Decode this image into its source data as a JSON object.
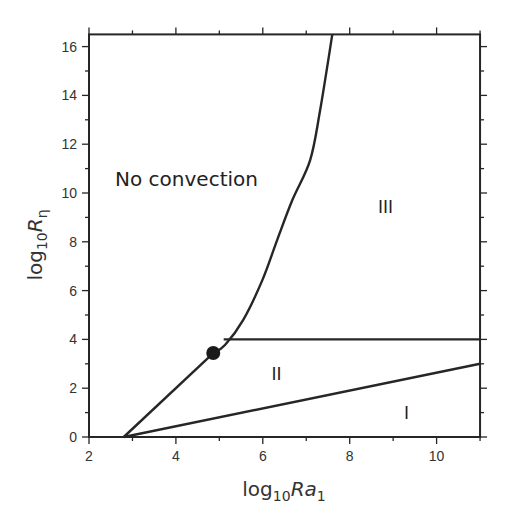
{
  "chart_data": {
    "type": "line",
    "title": "",
    "xlabel": "log10Ra1",
    "ylabel": "log10Rη",
    "xlabel_parts": {
      "base": "log",
      "sub1": "10",
      "var": "Ra",
      "sub2": "1"
    },
    "ylabel_parts": {
      "base": "log",
      "sub1": "10",
      "var": "R",
      "sub2": "η"
    },
    "xlim": [
      2,
      11
    ],
    "ylim": [
      0,
      16.5
    ],
    "grid": false,
    "legend": "none",
    "x_ticks": [
      2,
      4,
      6,
      8,
      10
    ],
    "x_minor_ticks": [
      3,
      5,
      7,
      9,
      11
    ],
    "y_ticks": [
      0,
      2,
      4,
      6,
      8,
      10,
      12,
      14,
      16
    ],
    "y_minor_ticks": [
      1,
      3,
      5,
      7,
      9,
      11,
      13,
      15
    ],
    "series": [
      {
        "name": "boundary-no-convection-lower",
        "x": [
          2.8,
          4.86
        ],
        "y": [
          0,
          3.44
        ]
      },
      {
        "name": "boundary-no-convection-III",
        "x": [
          4.86,
          5.13,
          5.55,
          5.99,
          6.33,
          6.68,
          7.09,
          7.32,
          7.6
        ],
        "y": [
          3.44,
          3.77,
          4.8,
          6.43,
          8.07,
          9.71,
          11.35,
          13.4,
          16.5
        ]
      },
      {
        "name": "boundary-II-III",
        "x": [
          5.1,
          11
        ],
        "y": [
          4,
          4
        ]
      },
      {
        "name": "boundary-I-II",
        "x": [
          2.8,
          11
        ],
        "y": [
          0,
          3
        ]
      }
    ],
    "points": [
      {
        "name": "triple-point",
        "x": 4.86,
        "y": 3.44
      }
    ],
    "annotations": [
      {
        "text": "No convection",
        "x": 2.6,
        "y": 10.3,
        "size": 20
      },
      {
        "text": "III",
        "x": 8.65,
        "y": 9.2,
        "size": 17
      },
      {
        "text": "II",
        "x": 6.2,
        "y": 2.35,
        "size": 17
      },
      {
        "text": "I",
        "x": 9.25,
        "y": 0.75,
        "size": 17
      }
    ]
  }
}
